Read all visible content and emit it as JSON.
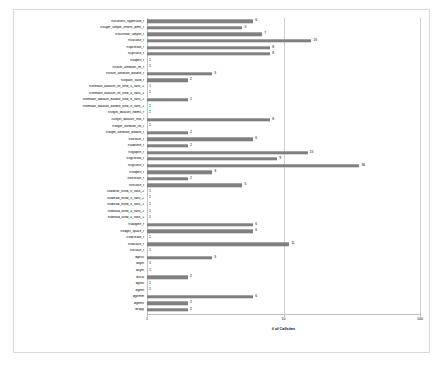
{
  "chart_data": {
    "type": "bar",
    "orientation": "horizontal",
    "title": "",
    "xlabel": "# of Callsites",
    "ylabel": "",
    "xscale": "log",
    "xlim": [
      1,
      100
    ],
    "xticks": [
      1,
      10,
      100
    ],
    "xticklabels": [
      "1",
      "10",
      "100"
    ],
    "grid": true,
    "legend": false,
    "bar_color": "#808080",
    "categories": [
      "h5sselect_hyperslab_f",
      "h5sget_simple_extent_dims_f",
      "h5screate_simple_f",
      "h5sclose_f",
      "h5pcreate_f",
      "h5pclose_f",
      "h5open_f",
      "h5ltset_attribute_int_f",
      "h5ltset_attribute_double_f",
      "h5ltpath_valid_f",
      "h5ltmake_dataset_int_kind_4_rank_2",
      "h5ltmake_dataset_int_kind_4_rank_1",
      "h5ltmake_dataset_double_kind_8_rank_2",
      "h5ltmake_dataset_double_kind_8_rank_1",
      "h5ltget_dataset_ndims_f",
      "h5ltget_dataset_info_f",
      "h5ltget_attribute_int_f",
      "h5ltget_attribute_double_f",
      "h5lexists_f",
      "h5ldelete_f",
      "h5gopen_f",
      "h5gcreate_f",
      "h5gclose_f",
      "h5fopen_f",
      "h5fcreate_f",
      "h5fclose_f",
      "h5dwrite_rkind_8_rank_2",
      "h5dread_rkind_8_rank_2",
      "h5dread_rkind_8_rank_1",
      "h5dread_ikind_4_rank_2",
      "h5dread_ikind_4_rank_1",
      "h5dopen_f",
      "h5dget_space_f",
      "h5dcreate_f",
      "h5dclose_f",
      "h5close_f",
      "dgesv",
      "dsytri",
      "dsytrf",
      "dscal",
      "dgetri",
      "dgetrf",
      "dgemm",
      "dgemv",
      "dcopy"
    ],
    "values": [
      6,
      5,
      7,
      16,
      8,
      8,
      1,
      1,
      3,
      2,
      1,
      1,
      2,
      1,
      1,
      8,
      1,
      2,
      6,
      2,
      15,
      9,
      36,
      3,
      2,
      5,
      1,
      1,
      1,
      1,
      1,
      6,
      6,
      1,
      11,
      1,
      3,
      1,
      1,
      2,
      1,
      1,
      6,
      2,
      2
    ]
  }
}
